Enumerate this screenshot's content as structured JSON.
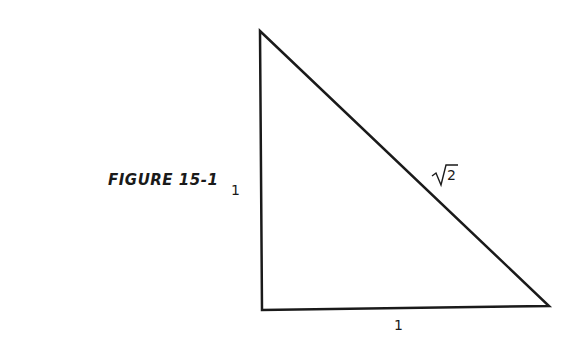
{
  "figure": {
    "caption": "FIGURE 15-1",
    "labels": {
      "left_side": "1",
      "bottom_side": "1",
      "hypotenuse_radicand": "2"
    },
    "triangle": {
      "vertices": {
        "top": [
          260,
          31
        ],
        "bottom_left": [
          262,
          310
        ],
        "bottom_right": [
          549,
          306
        ]
      },
      "stroke_color": "#1a1a1a"
    }
  }
}
